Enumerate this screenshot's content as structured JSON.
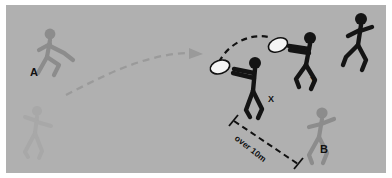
{
  "diagram": {
    "field_color": "#b0b0b0",
    "border_color": "#ffffff",
    "labels": {
      "player_a": "A",
      "player_b": "B",
      "player_x": "X",
      "player_y": "Y",
      "distance": "over 10m"
    },
    "colors": {
      "dark_player": "#1a1a1a",
      "mid_player": "#8c8c8c",
      "ghost_player": "#a6a6a6",
      "disc": "#f2f2f2",
      "dark_path": "#111111",
      "light_path": "#9a9a9a",
      "label_text": "#111111"
    },
    "elements": [
      {
        "name": "player-a-figure",
        "role": "thrower",
        "shade": "mid",
        "x": 48,
        "y": 52
      },
      {
        "name": "player-a-ghost-figure",
        "role": "previous-position",
        "shade": "ghost",
        "x": 35,
        "y": 130
      },
      {
        "name": "player-x-figure",
        "role": "catcher",
        "shade": "dark",
        "x": 240,
        "y": 82
      },
      {
        "name": "player-y-figure",
        "role": "second-thrower",
        "shade": "dark",
        "x": 292,
        "y": 58
      },
      {
        "name": "player-y-runner-figure",
        "role": "cutter",
        "shade": "dark",
        "x": 350,
        "y": 32
      },
      {
        "name": "player-b-figure",
        "role": "defender",
        "shade": "mid",
        "x": 318,
        "y": 128
      },
      {
        "name": "disc-first",
        "role": "disc",
        "x": 214,
        "y": 62
      },
      {
        "name": "disc-second",
        "role": "disc",
        "x": 272,
        "y": 40
      }
    ],
    "paths": [
      {
        "name": "throw-arc-a-to-x",
        "style": "dashed",
        "shade": "light",
        "arrowhead": true
      },
      {
        "name": "throw-arc-x-to-y",
        "style": "dashed",
        "shade": "dark",
        "arrowhead": false
      },
      {
        "name": "distance-measure-line",
        "style": "dashed",
        "shade": "dark",
        "endcaps": "tick"
      }
    ]
  }
}
